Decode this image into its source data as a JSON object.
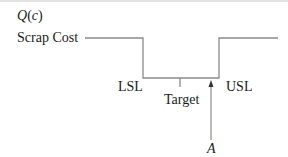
{
  "figure": {
    "y_axis_label": "Q(c)",
    "y_axis_label_parts": {
      "q": "Q",
      "open": "(",
      "c": "c",
      "close": ")"
    },
    "scrap_cost_label": "Scrap Cost",
    "lsl_label": "LSL",
    "target_label": "Target",
    "usl_label": "USL",
    "point_label": "A",
    "line_color": "#8a8a8a",
    "text_color": "#1a1a1a"
  }
}
